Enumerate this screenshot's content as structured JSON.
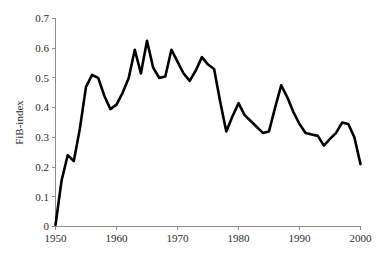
{
  "chart_data": {
    "type": "line",
    "title": "",
    "subtitle": "",
    "xlabel": "",
    "ylabel": "FiB-index",
    "xlim": [
      1950,
      2000
    ],
    "ylim": [
      0,
      0.7
    ],
    "grid": false,
    "legend": null,
    "legend_position": "none",
    "annotations": [],
    "x_ticks": [
      "1950",
      "1960",
      "1970",
      "1980",
      "1990",
      "2000"
    ],
    "x_tick_values": [
      1950,
      1960,
      1970,
      1980,
      1990,
      2000
    ],
    "y_ticks": [
      "0",
      "0.1",
      "0.2",
      "0.3",
      "0.4",
      "0.5",
      "0.6",
      "0.7"
    ],
    "y_tick_values": [
      0,
      0.1,
      0.2,
      0.3,
      0.4,
      0.5,
      0.6,
      0.7
    ],
    "line_color": "#000000",
    "axis_color": "#8c8c8c",
    "background_color": "#ffffff",
    "x": [
      1950,
      1951,
      1952,
      1953,
      1954,
      1955,
      1956,
      1957,
      1958,
      1959,
      1960,
      1961,
      1962,
      1963,
      1964,
      1965,
      1966,
      1967,
      1968,
      1969,
      1970,
      1971,
      1972,
      1973,
      1974,
      1975,
      1976,
      1977,
      1978,
      1979,
      1980,
      1981,
      1982,
      1983,
      1984,
      1985,
      1986,
      1987,
      1988,
      1989,
      1990,
      1991,
      1992,
      1993,
      1994,
      1995,
      1996,
      1997,
      1998,
      1999,
      2000
    ],
    "values": [
      0.005,
      0.155,
      0.24,
      0.22,
      0.33,
      0.47,
      0.51,
      0.5,
      0.44,
      0.395,
      0.41,
      0.45,
      0.5,
      0.595,
      0.515,
      0.625,
      0.535,
      0.5,
      0.505,
      0.595,
      0.555,
      0.515,
      0.49,
      0.525,
      0.57,
      0.545,
      0.53,
      0.42,
      0.32,
      0.37,
      0.415,
      0.375,
      0.355,
      0.335,
      0.315,
      0.32,
      0.4,
      0.475,
      0.435,
      0.385,
      0.345,
      0.315,
      0.31,
      0.305,
      0.272,
      0.295,
      0.315,
      0.35,
      0.345,
      0.3,
      0.21
    ],
    "series": [
      {
        "name": "FiB-index",
        "values": [
          0.005,
          0.155,
          0.24,
          0.22,
          0.33,
          0.47,
          0.51,
          0.5,
          0.44,
          0.395,
          0.41,
          0.45,
          0.5,
          0.595,
          0.515,
          0.625,
          0.535,
          0.5,
          0.505,
          0.595,
          0.555,
          0.515,
          0.49,
          0.525,
          0.57,
          0.545,
          0.53,
          0.42,
          0.32,
          0.37,
          0.415,
          0.375,
          0.355,
          0.335,
          0.315,
          0.32,
          0.4,
          0.475,
          0.435,
          0.385,
          0.345,
          0.315,
          0.31,
          0.305,
          0.272,
          0.295,
          0.315,
          0.35,
          0.345,
          0.3,
          0.21
        ]
      }
    ]
  }
}
